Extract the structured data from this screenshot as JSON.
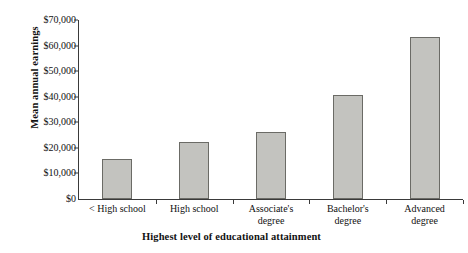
{
  "chart_data": {
    "type": "bar",
    "title": "",
    "xlabel": "Highest level of educational attainment",
    "ylabel": "Mean annual earnings",
    "categories": [
      "< High school",
      "High school",
      "Associate's degree",
      "Bachelor's degree",
      "Advanced degree"
    ],
    "category_lines": [
      [
        "< High school"
      ],
      [
        "High school"
      ],
      [
        "Associate's",
        "degree"
      ],
      [
        "Bachelor's",
        "degree"
      ],
      [
        "Advanced",
        "degree"
      ]
    ],
    "values": [
      15600,
      22300,
      26200,
      40700,
      63400
    ],
    "ylim": [
      0,
      70000
    ],
    "ytick_values": [
      0,
      10000,
      20000,
      30000,
      40000,
      50000,
      60000,
      70000
    ],
    "ytick_labels": [
      "$0",
      "$10,000",
      "$20,000",
      "$30,000",
      "$40,000",
      "$50,000",
      "$60,000",
      "$70,000"
    ],
    "grid": false,
    "legend": null,
    "bar_fill_color": "#c3c3bf",
    "bar_border_color": "#6b6b66",
    "axis_color": "#3a3a3a",
    "background_color": "#ffffff"
  }
}
